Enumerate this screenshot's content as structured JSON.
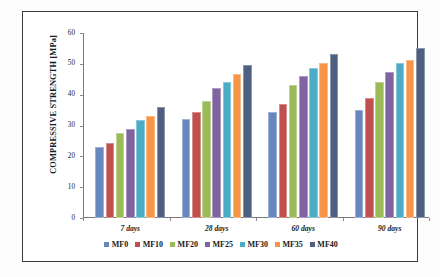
{
  "chart_data": {
    "type": "bar",
    "title": "",
    "subtitle": "",
    "xlabel": "",
    "ylabel": "COMPRESSIVE STRENGTH [MPa]",
    "categories": [
      "7 days",
      "28 days",
      "60 days",
      "90 days"
    ],
    "ylim": [
      0,
      60
    ],
    "yticks": [
      0,
      10,
      20,
      30,
      40,
      50,
      60
    ],
    "ytick_labels": [
      "0",
      "10",
      "20",
      "30",
      "40",
      "50",
      "60"
    ],
    "grid": false,
    "legend_position": "bottom",
    "series": [
      {
        "name": "MF0",
        "color": "#6987bf",
        "values": [
          23.0,
          32.0,
          34.3,
          34.9
        ]
      },
      {
        "name": "MF10",
        "color": "#c0504d",
        "values": [
          24.3,
          34.5,
          37.0,
          38.9
        ]
      },
      {
        "name": "MF20",
        "color": "#9bbb59",
        "values": [
          27.6,
          38.0,
          43.0,
          44.1
        ]
      },
      {
        "name": "MF25",
        "color": "#8064a2",
        "values": [
          28.8,
          42.2,
          46.1,
          47.4
        ]
      },
      {
        "name": "MF30",
        "color": "#4bacc6",
        "values": [
          31.9,
          44.2,
          48.5,
          50.3
        ]
      },
      {
        "name": "MF35",
        "color": "#f79646",
        "values": [
          33.1,
          46.7,
          50.3,
          51.3
        ]
      },
      {
        "name": "MF40",
        "color": "#4f5f7f",
        "values": [
          35.9,
          49.6,
          53.1,
          55.0
        ]
      }
    ]
  },
  "colors": {
    "frame": "#3b3b3b",
    "axis": "#7a7a7a",
    "text": "#1a1a1a",
    "background": "#ffffff"
  }
}
